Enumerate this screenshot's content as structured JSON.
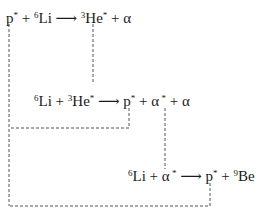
{
  "reactions": [
    {
      "id": "r1",
      "reactants": [
        {
          "symbol": "p",
          "mass": "",
          "excited": "*"
        },
        {
          "symbol": "Li",
          "mass": "6",
          "excited": ""
        }
      ],
      "products": [
        {
          "symbol": "He",
          "mass": "3",
          "excited": "*"
        },
        {
          "symbol": "α",
          "mass": "",
          "excited": ""
        }
      ]
    },
    {
      "id": "r2",
      "reactants": [
        {
          "symbol": "Li",
          "mass": "6",
          "excited": ""
        },
        {
          "symbol": "He",
          "mass": "3",
          "excited": "*"
        }
      ],
      "products": [
        {
          "symbol": "p",
          "mass": "",
          "excited": "*"
        },
        {
          "symbol": "α",
          "mass": "",
          "excited": " *"
        },
        {
          "symbol": "α",
          "mass": "",
          "excited": ""
        }
      ]
    },
    {
      "id": "r3",
      "reactants": [
        {
          "symbol": "Li",
          "mass": "6",
          "excited": ""
        },
        {
          "symbol": "α",
          "mass": "",
          "excited": " *"
        }
      ],
      "products": [
        {
          "symbol": "p",
          "mass": "",
          "excited": "*"
        },
        {
          "symbol": "Be",
          "mass": "9",
          "excited": ""
        }
      ]
    }
  ],
  "symbols": {
    "plus": "+",
    "arrow": "⟶"
  },
  "connections": [
    {
      "from": "r1.products.0 (³He*)",
      "to": "r2.reactants.1 (³He*)"
    },
    {
      "from": "r2.products.0 (p*)",
      "to": "r1.reactants.0 (p*)"
    },
    {
      "from": "r2.products.1 (α*)",
      "to": "r3.reactants.1 (α*)"
    },
    {
      "from": "r3.products.0 (p*)",
      "to": "r1.reactants.0 (p*)"
    }
  ]
}
